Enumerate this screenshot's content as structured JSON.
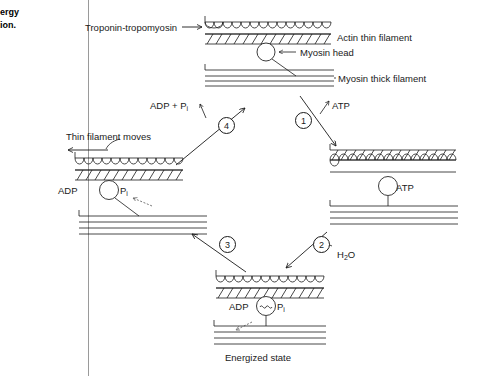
{
  "figure": {
    "caption_fragment_line1": "ergy",
    "caption_fragment_line2": "ion.",
    "bottom_caption": "Energized state"
  },
  "labels": {
    "troponin_tropomyosin": "Troponin-tropomyosin",
    "arrow_glyph": "→",
    "actin_thin_filament": "Actin thin filament",
    "myosin_head": "Myosin head",
    "myosin_thick_filament": "Myosin thick filament",
    "adp_plus_pi_adp": "ADP + P",
    "adp_plus_pi_sub": "i",
    "atp_step1": "ATP",
    "atp_bound": "ATP",
    "thin_filament_moves": "Thin filament moves",
    "adp_left": "ADP",
    "pi_left": "P",
    "pi_left_sub": "i",
    "water": "H",
    "water_sub": "2",
    "water_tail": "O",
    "adp_bottom": "ADP",
    "pi_bottom": "P",
    "pi_bottom_sub": "i",
    "energy_bond": "~"
  },
  "steps": [
    {
      "number": "1",
      "description": "ATP binds to myosin head"
    },
    {
      "number": "2",
      "description": "ATP hydrolysis with H2O"
    },
    {
      "number": "3",
      "description": "Energized head attaches to actin"
    },
    {
      "number": "4",
      "description": "Power stroke releases ADP and Pi"
    }
  ],
  "states": [
    {
      "name": "attached-state-top",
      "position": "top"
    },
    {
      "name": "atp-bound-state-right",
      "position": "right"
    },
    {
      "name": "energized-state-bottom",
      "position": "bottom"
    },
    {
      "name": "power-stroke-state-left",
      "position": "left"
    }
  ],
  "colors": {
    "ink": "#1a1a1a",
    "divider": "#9a9a9a",
    "dashed_arrow": "#555555",
    "background": "#ffffff"
  }
}
